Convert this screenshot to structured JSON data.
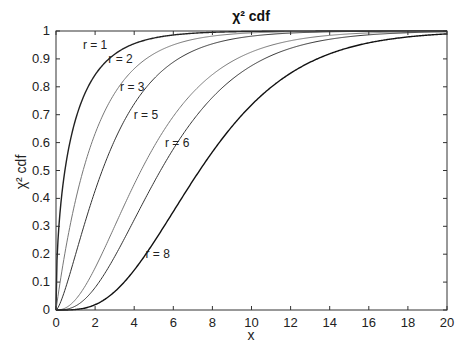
{
  "chart_data": {
    "type": "line",
    "title": "χ² cdf",
    "xlabel": "x",
    "ylabel": "χ² cdf",
    "xlim": [
      0,
      20
    ],
    "ylim": [
      0,
      1
    ],
    "xticks": [
      0,
      2,
      4,
      6,
      8,
      10,
      12,
      14,
      16,
      18,
      20
    ],
    "yticks": [
      0,
      0.1,
      0.2,
      0.3,
      0.4,
      0.5,
      0.6,
      0.7,
      0.8,
      0.9,
      1
    ],
    "grid": false,
    "legend": "inline annotations",
    "series": [
      {
        "name": "r = 1",
        "df": 1,
        "color": "#222222",
        "width": 1.4
      },
      {
        "name": "r = 2",
        "df": 2,
        "color": "#777777",
        "width": 1.0
      },
      {
        "name": "r = 3",
        "df": 3,
        "color": "#333333",
        "width": 1.0
      },
      {
        "name": "r = 5",
        "df": 5,
        "color": "#777777",
        "width": 1.0
      },
      {
        "name": "r = 6",
        "df": 6,
        "color": "#333333",
        "width": 1.0
      },
      {
        "name": "r = 8",
        "df": 8,
        "color": "#111111",
        "width": 1.4
      }
    ],
    "annotations": [
      {
        "text": "r = 1",
        "x": 2.0,
        "y": 0.95
      },
      {
        "text": "r = 2",
        "x": 3.3,
        "y": 0.9
      },
      {
        "text": "r = 3",
        "x": 3.9,
        "y": 0.8
      },
      {
        "text": "r = 5",
        "x": 4.6,
        "y": 0.7
      },
      {
        "text": "r = 6",
        "x": 6.2,
        "y": 0.6
      },
      {
        "text": "r = 8",
        "x": 5.2,
        "y": 0.2
      }
    ]
  }
}
